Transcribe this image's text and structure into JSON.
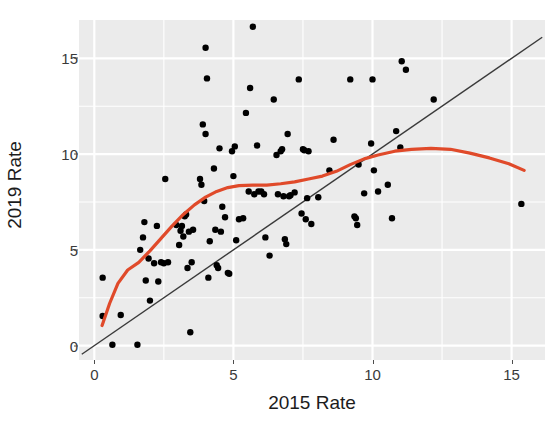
{
  "chart_data": {
    "type": "scatter",
    "title": "",
    "xlabel": "2015 Rate",
    "ylabel": "2019 Rate",
    "xlim": [
      -0.55,
      16.2
    ],
    "ylim": [
      -0.75,
      17.0
    ],
    "xticks": [
      0,
      5,
      10,
      15
    ],
    "yticks": [
      0,
      5,
      10,
      15
    ],
    "xtick_labels": [
      "0",
      "5",
      "10",
      "15"
    ],
    "ytick_labels": [
      "0",
      "5",
      "10",
      "15"
    ],
    "grid": true,
    "grid_color": "#ffffff",
    "panel_background": "#ebebeb",
    "legend": "none",
    "point_color": "#000000",
    "point_size": 3.2,
    "points": [
      [
        0.3,
        3.55
      ],
      [
        0.3,
        1.55
      ],
      [
        0.65,
        0.05
      ],
      [
        0.95,
        1.6
      ],
      [
        1.55,
        0.05
      ],
      [
        1.65,
        5.0
      ],
      [
        1.75,
        5.65
      ],
      [
        1.8,
        6.45
      ],
      [
        1.85,
        3.4
      ],
      [
        1.95,
        4.55
      ],
      [
        2.0,
        2.35
      ],
      [
        2.15,
        4.3
      ],
      [
        2.25,
        6.25
      ],
      [
        2.3,
        3.35
      ],
      [
        2.4,
        4.35
      ],
      [
        2.5,
        4.3
      ],
      [
        2.55,
        8.7
      ],
      [
        2.65,
        4.35
      ],
      [
        2.95,
        6.3
      ],
      [
        3.05,
        5.25
      ],
      [
        3.1,
        6.0
      ],
      [
        3.15,
        6.25
      ],
      [
        3.2,
        5.7
      ],
      [
        3.25,
        6.75
      ],
      [
        3.3,
        6.85
      ],
      [
        3.35,
        4.05
      ],
      [
        3.4,
        5.95
      ],
      [
        3.45,
        0.7
      ],
      [
        3.5,
        4.35
      ],
      [
        3.55,
        6.05
      ],
      [
        3.8,
        8.7
      ],
      [
        3.85,
        8.4
      ],
      [
        3.9,
        11.55
      ],
      [
        3.95,
        7.55
      ],
      [
        4.0,
        15.55
      ],
      [
        4.0,
        11.05
      ],
      [
        4.05,
        13.95
      ],
      [
        4.1,
        3.55
      ],
      [
        4.15,
        5.45
      ],
      [
        4.3,
        9.25
      ],
      [
        4.35,
        6.05
      ],
      [
        4.4,
        4.2
      ],
      [
        4.45,
        4.05
      ],
      [
        4.5,
        10.3
      ],
      [
        4.55,
        5.95
      ],
      [
        4.6,
        7.25
      ],
      [
        4.7,
        6.7
      ],
      [
        4.8,
        3.8
      ],
      [
        4.85,
        3.75
      ],
      [
        4.95,
        10.15
      ],
      [
        5.0,
        8.85
      ],
      [
        5.05,
        10.4
      ],
      [
        5.1,
        5.5
      ],
      [
        5.2,
        6.6
      ],
      [
        5.35,
        6.65
      ],
      [
        5.45,
        12.15
      ],
      [
        5.55,
        8.05
      ],
      [
        5.6,
        13.45
      ],
      [
        5.7,
        16.65
      ],
      [
        5.75,
        7.9
      ],
      [
        5.85,
        10.45
      ],
      [
        5.9,
        8.05
      ],
      [
        6.0,
        8.05
      ],
      [
        6.1,
        7.9
      ],
      [
        6.15,
        5.65
      ],
      [
        6.3,
        4.7
      ],
      [
        6.45,
        12.85
      ],
      [
        6.55,
        9.95
      ],
      [
        6.6,
        7.9
      ],
      [
        6.7,
        10.15
      ],
      [
        6.75,
        10.25
      ],
      [
        6.8,
        7.8
      ],
      [
        6.85,
        5.55
      ],
      [
        6.9,
        5.3
      ],
      [
        6.95,
        11.05
      ],
      [
        7.0,
        7.8
      ],
      [
        7.05,
        7.85
      ],
      [
        7.2,
        8.0
      ],
      [
        7.35,
        13.9
      ],
      [
        7.45,
        6.9
      ],
      [
        7.5,
        10.25
      ],
      [
        7.55,
        10.2
      ],
      [
        7.6,
        6.6
      ],
      [
        7.65,
        7.7
      ],
      [
        7.7,
        10.15
      ],
      [
        7.8,
        6.35
      ],
      [
        8.05,
        7.75
      ],
      [
        8.45,
        9.15
      ],
      [
        8.6,
        10.75
      ],
      [
        9.2,
        13.9
      ],
      [
        9.35,
        6.75
      ],
      [
        9.4,
        6.65
      ],
      [
        9.45,
        6.3
      ],
      [
        9.5,
        9.45
      ],
      [
        9.7,
        7.95
      ],
      [
        9.95,
        10.55
      ],
      [
        10.0,
        13.9
      ],
      [
        10.05,
        9.15
      ],
      [
        10.2,
        8.05
      ],
      [
        10.55,
        8.4
      ],
      [
        10.7,
        6.65
      ],
      [
        10.85,
        11.2
      ],
      [
        11.0,
        10.35
      ],
      [
        11.05,
        14.85
      ],
      [
        11.2,
        14.4
      ],
      [
        12.2,
        12.85
      ],
      [
        15.35,
        7.4
      ]
    ],
    "smooth_curve": {
      "name": "loess-smoother",
      "color": "#e04a2a",
      "width": 3.2,
      "points": [
        [
          0.28,
          1.05
        ],
        [
          0.55,
          2.2
        ],
        [
          0.85,
          3.25
        ],
        [
          1.2,
          3.95
        ],
        [
          1.6,
          4.35
        ],
        [
          2.0,
          4.95
        ],
        [
          2.4,
          5.6
        ],
        [
          2.8,
          6.25
        ],
        [
          3.2,
          6.85
        ],
        [
          3.6,
          7.35
        ],
        [
          4.0,
          7.75
        ],
        [
          4.4,
          8.05
        ],
        [
          4.8,
          8.25
        ],
        [
          5.2,
          8.35
        ],
        [
          5.7,
          8.38
        ],
        [
          6.2,
          8.38
        ],
        [
          6.7,
          8.45
        ],
        [
          7.2,
          8.55
        ],
        [
          7.7,
          8.7
        ],
        [
          8.2,
          8.85
        ],
        [
          8.7,
          9.1
        ],
        [
          9.2,
          9.45
        ],
        [
          9.7,
          9.75
        ],
        [
          10.2,
          9.95
        ],
        [
          10.8,
          10.15
        ],
        [
          11.4,
          10.25
        ],
        [
          12.1,
          10.3
        ],
        [
          12.8,
          10.25
        ],
        [
          13.5,
          10.05
        ],
        [
          14.2,
          9.8
        ],
        [
          14.9,
          9.5
        ],
        [
          15.45,
          9.15
        ]
      ]
    },
    "reference_line": {
      "name": "identity-line",
      "color": "#3a3a3a",
      "width": 1.4,
      "intercept": 0,
      "slope": 1,
      "x_start": -0.45,
      "x_end": 16.1
    }
  },
  "axes": {
    "y_title": "2019 Rate",
    "x_title": "2015 Rate"
  }
}
